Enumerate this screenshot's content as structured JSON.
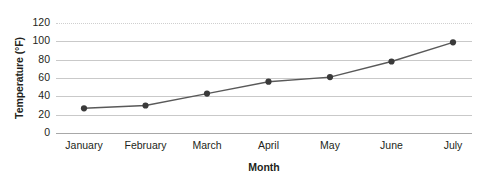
{
  "chart_data": {
    "type": "line",
    "title": "",
    "xlabel": "Month",
    "ylabel": "Temperature (°F)",
    "categories": [
      "January",
      "February",
      "March",
      "April",
      "May",
      "June",
      "July"
    ],
    "values": [
      27,
      30,
      43,
      56,
      61,
      78,
      99
    ],
    "series": [
      {
        "name": "Temperature",
        "values": [
          27,
          30,
          43,
          56,
          61,
          78,
          99
        ]
      }
    ],
    "ylim": [
      0,
      120
    ],
    "y_ticks": [
      0,
      20,
      40,
      60,
      80,
      100,
      120
    ],
    "y_tick_labels": [
      "0",
      "20",
      "40",
      "60",
      "80",
      "100",
      "120"
    ],
    "grid": "horizontal",
    "legend": "none",
    "line_color": "#595959",
    "marker_color": "#3a3a3a",
    "gridline_color": "#c9c9c9",
    "axis_color": "#a8a8a8",
    "text_color": "#231f20",
    "background": "#ffffff"
  }
}
